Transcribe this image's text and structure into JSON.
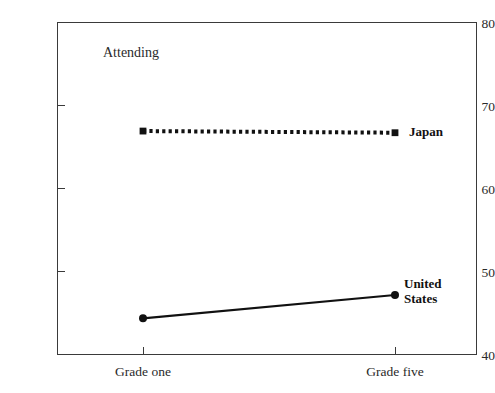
{
  "chart_data": {
    "type": "line",
    "title": "",
    "panel_label": "Attending",
    "xlabel": "",
    "ylabel": "Percentage of total time",
    "categories": [
      "Grade one",
      "Grade five"
    ],
    "ylim": [
      40,
      80
    ],
    "yticks": [
      40,
      50,
      60,
      70,
      80
    ],
    "ytick_labels": [
      "40",
      "50",
      "60",
      "70",
      "80"
    ],
    "grid": false,
    "legend_position": "right-of-line-ends",
    "series": [
      {
        "name": "Japan",
        "values": [
          66.9,
          66.7
        ],
        "line_style": "dotted",
        "marker": "square",
        "color": "#111111"
      },
      {
        "name": "United States",
        "values": [
          44.4,
          47.2
        ],
        "line_style": "solid",
        "marker": "circle",
        "color": "#111111"
      }
    ],
    "series_end_labels": [
      "Japan",
      "United\nStates"
    ]
  },
  "axis": {
    "y_title": "Percentage of total time",
    "y_labels": [
      "80",
      "70",
      "60",
      "50",
      "40"
    ],
    "x_labels": [
      "Grade one",
      "Grade five"
    ]
  },
  "colors": {
    "axis": "#3a3a3a",
    "series": "#111111",
    "background": "#ffffff",
    "text": "#1a1a1a"
  }
}
